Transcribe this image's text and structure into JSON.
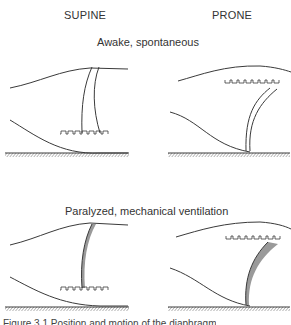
{
  "columns": {
    "left": "SUPINE",
    "right": "PRONE"
  },
  "rows": [
    {
      "label": "Awake, spontaneous"
    },
    {
      "label": "Paralyzed, mechanical ventilation"
    }
  ],
  "caption": "Figure 3.1  Position and motion of the diaphragm",
  "colors": {
    "line": "#3a3a3a",
    "shade": "#9a9a9a",
    "hatch": "#555555"
  }
}
